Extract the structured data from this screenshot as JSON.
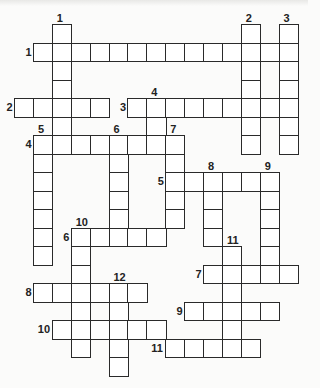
{
  "puzzle": {
    "type": "crossword",
    "grid": {
      "origin_x": 14,
      "origin_y": 24,
      "cell_w": 18.9,
      "cell_h": 18.5
    },
    "across": [
      {
        "number": "1",
        "row": 1,
        "col": 1,
        "length": 14
      },
      {
        "number": "2",
        "row": 4,
        "col": 0,
        "length": 5
      },
      {
        "number": "3",
        "row": 4,
        "col": 6,
        "length": 9
      },
      {
        "number": "4",
        "row": 6,
        "col": 1,
        "length": 8
      },
      {
        "number": "5",
        "row": 8,
        "col": 8,
        "length": 6
      },
      {
        "number": "6",
        "row": 11,
        "col": 3,
        "length": 5
      },
      {
        "number": "7",
        "row": 13,
        "col": 10,
        "length": 5
      },
      {
        "number": "8",
        "row": 14,
        "col": 1,
        "length": 6
      },
      {
        "number": "9",
        "row": 15,
        "col": 9,
        "length": 5
      },
      {
        "number": "10",
        "row": 16,
        "col": 2,
        "length": 6
      },
      {
        "number": "11",
        "row": 17,
        "col": 8,
        "length": 5
      }
    ],
    "down": [
      {
        "number": "1",
        "row": 0,
        "col": 2,
        "length": 7
      },
      {
        "number": "2",
        "row": 0,
        "col": 12,
        "length": 7
      },
      {
        "number": "3",
        "row": 0,
        "col": 14,
        "length": 7
      },
      {
        "number": "4",
        "row": 4,
        "col": 7,
        "length": 3
      },
      {
        "number": "5",
        "row": 6,
        "col": 1,
        "length": 7
      },
      {
        "number": "6",
        "row": 6,
        "col": 5,
        "length": 6
      },
      {
        "number": "7",
        "row": 6,
        "col": 8,
        "length": 5
      },
      {
        "number": "8",
        "row": 8,
        "col": 10,
        "length": 4
      },
      {
        "number": "9",
        "row": 8,
        "col": 13,
        "length": 6
      },
      {
        "number": "10",
        "row": 11,
        "col": 3,
        "length": 7
      },
      {
        "number": "11",
        "row": 12,
        "col": 11,
        "length": 6
      },
      {
        "number": "12",
        "row": 14,
        "col": 5,
        "length": 5
      }
    ]
  }
}
